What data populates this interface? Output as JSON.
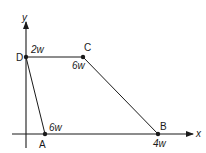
{
  "diagram": {
    "axes": {
      "x_label": "x",
      "y_label": "y"
    },
    "points": [
      {
        "id": "D",
        "label": "D",
        "load": "2w"
      },
      {
        "id": "C",
        "label": "C",
        "load": "6w"
      },
      {
        "id": "A",
        "label": "A",
        "load": "6w"
      },
      {
        "id": "B",
        "label": "B",
        "load": "4w"
      }
    ],
    "edges": [
      {
        "from": "A",
        "to": "D"
      },
      {
        "from": "D",
        "to": "C"
      },
      {
        "from": "C",
        "to": "B"
      }
    ],
    "colors": {
      "line": "#1a1a1a",
      "background": "#ffffff"
    }
  }
}
